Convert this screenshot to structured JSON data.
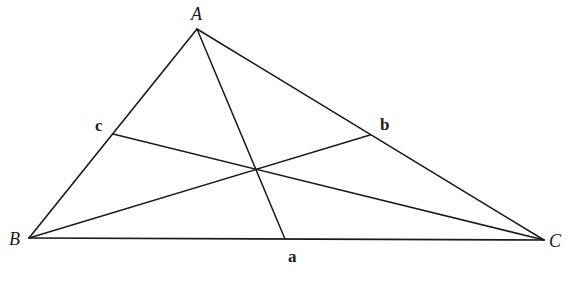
{
  "diagram": {
    "type": "triangle-medians",
    "vertices": {
      "A": {
        "label": "A",
        "x": 197,
        "y": 29,
        "label_x": 191,
        "label_y": 20
      },
      "B": {
        "label": "B",
        "x": 29,
        "y": 238,
        "label_x": 9,
        "label_y": 245
      },
      "C": {
        "label": "C",
        "x": 544,
        "y": 240,
        "label_x": 549,
        "label_y": 247
      }
    },
    "midpoints": {
      "a": {
        "label": "a",
        "x": 285,
        "y": 239,
        "label_x": 288,
        "label_y": 262,
        "on_side": "BC"
      },
      "b": {
        "label": "b",
        "x": 370,
        "y": 135,
        "label_x": 380,
        "label_y": 130,
        "on_side": "CA"
      },
      "c": {
        "label": "c",
        "x": 113,
        "y": 134,
        "label_x": 95,
        "label_y": 131,
        "on_side": "AB"
      }
    },
    "medians": [
      {
        "from": "A",
        "to": "a"
      },
      {
        "from": "B",
        "to": "b"
      },
      {
        "from": "C",
        "to": "c"
      }
    ],
    "centroid": {
      "x": 256,
      "y": 170
    },
    "line_color": "#1a1a1a",
    "background": "#ffffff"
  }
}
